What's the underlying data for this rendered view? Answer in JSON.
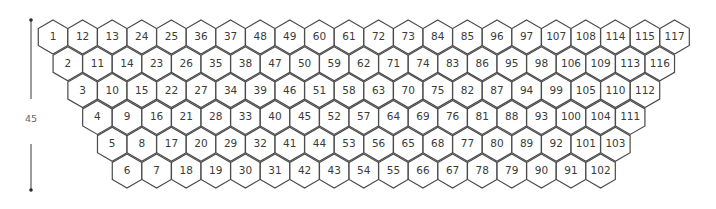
{
  "diagram": {
    "type": "hexagon-grid",
    "ruler": {
      "label": "45"
    },
    "rows": [
      [
        "1",
        "12",
        "13",
        "24",
        "25",
        "36",
        "37",
        "48",
        "49",
        "60",
        "61",
        "72",
        "73",
        "84",
        "85",
        "96",
        "97",
        "107",
        "108",
        "114",
        "115",
        "117"
      ],
      [
        "2",
        "11",
        "14",
        "23",
        "26",
        "35",
        "38",
        "47",
        "50",
        "59",
        "62",
        "71",
        "74",
        "83",
        "86",
        "95",
        "98",
        "106",
        "109",
        "113",
        "116"
      ],
      [
        "3",
        "10",
        "15",
        "22",
        "27",
        "34",
        "39",
        "46",
        "51",
        "58",
        "63",
        "70",
        "75",
        "82",
        "87",
        "94",
        "99",
        "105",
        "110",
        "112"
      ],
      [
        "4",
        "9",
        "16",
        "21",
        "28",
        "33",
        "40",
        "45",
        "52",
        "57",
        "64",
        "69",
        "76",
        "81",
        "88",
        "93",
        "100",
        "104",
        "111"
      ],
      [
        "5",
        "8",
        "17",
        "20",
        "29",
        "32",
        "41",
        "44",
        "53",
        "56",
        "65",
        "68",
        "77",
        "80",
        "89",
        "92",
        "101",
        "103"
      ],
      [
        "6",
        "7",
        "18",
        "19",
        "30",
        "31",
        "42",
        "43",
        "54",
        "55",
        "66",
        "67",
        "78",
        "79",
        "90",
        "91",
        "102"
      ]
    ],
    "colors": {
      "stroke": "#4a4a4a",
      "fill": "#ffffff",
      "text": "#3a3a3a"
    }
  }
}
